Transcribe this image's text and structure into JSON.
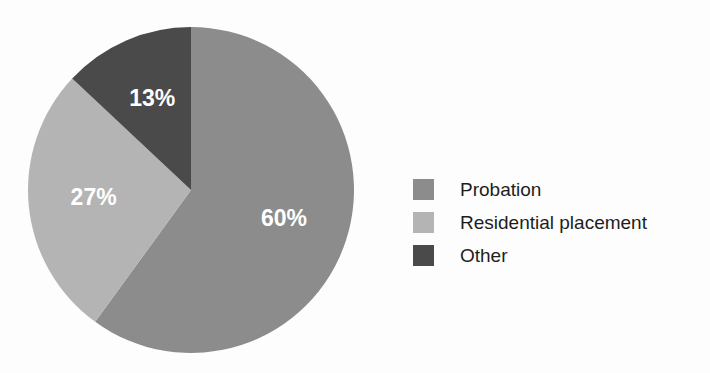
{
  "chart_data": {
    "type": "pie",
    "title": "",
    "categories": [
      "Probation",
      "Residential placement",
      "Other"
    ],
    "values": [
      60,
      27,
      13
    ],
    "value_labels": [
      "60%",
      "27%",
      "13%"
    ],
    "unit": "%",
    "start_angle_deg": 0,
    "direction": "clockwise",
    "colors": [
      "#8c8c8c",
      "#b4b4b4",
      "#4a4a4a"
    ],
    "label_color": "#ffffff",
    "background": "#fdfdfd",
    "legend": {
      "position": "right",
      "entries": [
        {
          "label": "Probation",
          "color": "#8c8c8c",
          "value_label": "60%"
        },
        {
          "label": "Residential placement",
          "color": "#b4b4b4",
          "value_label": "27%"
        },
        {
          "label": "Other",
          "color": "#4a4a4a",
          "value_label": "13%"
        }
      ]
    },
    "slices": [
      {
        "label": "Probation",
        "value": 60,
        "value_label": "60%",
        "color": "#8c8c8c"
      },
      {
        "label": "Residential placement",
        "value": 27,
        "value_label": "27%",
        "color": "#b4b4b4"
      },
      {
        "label": "Other",
        "value": 13,
        "value_label": "13%",
        "color": "#4a4a4a"
      }
    ]
  }
}
